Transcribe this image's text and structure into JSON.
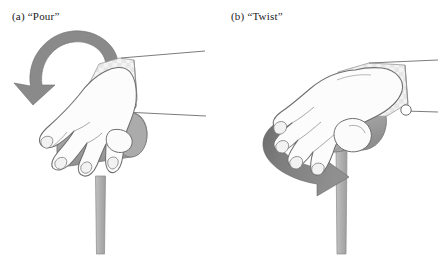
{
  "figure": {
    "background_color": "#ffffff",
    "width": 438,
    "height": 256,
    "panels": [
      {
        "id": "a",
        "caption": "(a)  “Pour”",
        "label_letter": "(a)",
        "movement_name": "Pour",
        "arrow": {
          "icon": "curved-rotation-arrow-vertical",
          "direction": "counterclockwise-downward",
          "color": "#8a8a8a"
        },
        "objects": [
          {
            "name": "hand",
            "color": "#fbfbfb",
            "outline": "#6e6e6e"
          },
          {
            "name": "sleeve",
            "color": "#f0f0f0",
            "pattern": "checkered-dots"
          },
          {
            "name": "cuff-button",
            "color": "#ffffff"
          },
          {
            "name": "cylinder",
            "orientation": "horizontal",
            "color": "#a6a6a6"
          },
          {
            "name": "post",
            "orientation": "vertical",
            "color": "#b0b0b0"
          }
        ]
      },
      {
        "id": "b",
        "caption": "(b)  “Twist”",
        "label_letter": "(b)",
        "movement_name": "Twist",
        "arrow": {
          "icon": "elliptical-rotation-arrow-horizontal",
          "direction": "clockwise-around-vertical-axis",
          "color": "#8a8a8a"
        },
        "objects": [
          {
            "name": "hand",
            "color": "#fbfbfb",
            "outline": "#6e6e6e"
          },
          {
            "name": "sleeve",
            "color": "#f0f0f0",
            "pattern": "checkered-dots"
          },
          {
            "name": "cuff-button",
            "color": "#ffffff"
          },
          {
            "name": "cylinder",
            "orientation": "end-on",
            "color": "#a6a6a6"
          },
          {
            "name": "post",
            "orientation": "vertical",
            "color": "#b0b0b0"
          }
        ]
      }
    ],
    "colors": {
      "arrow_gray": "#8a8a8a",
      "arrow_gray_dark": "#6f6f6f",
      "cylinder_gray": "#a6a6a6",
      "cylinder_gray_dark": "#919191",
      "post_gray": "#b0b0b0",
      "outline": "#6e6e6e",
      "text": "#1a1a1a",
      "hand_fill": "#fcfcfc",
      "sleeve_fill": "#f2f2f2",
      "sleeve_dot": "#e2e2e2"
    }
  }
}
